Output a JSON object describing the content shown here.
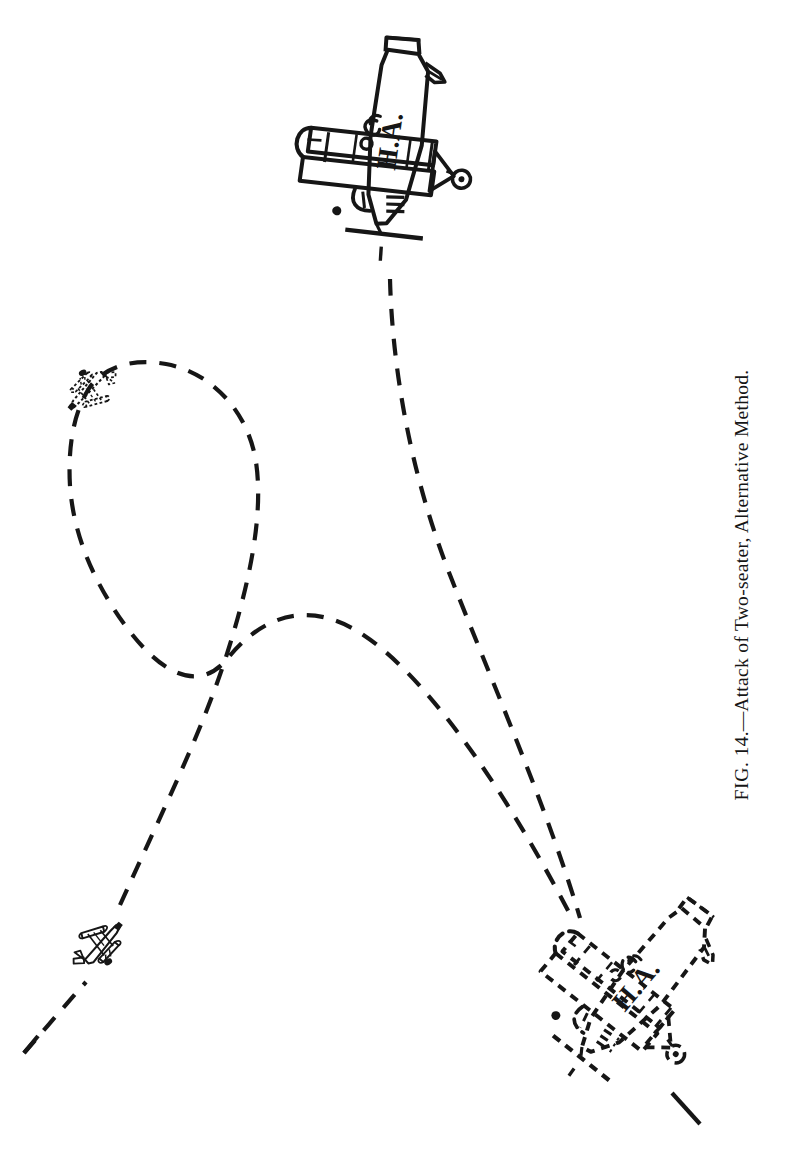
{
  "page": {
    "width": 794,
    "height": 1170,
    "background_color": "#ffffff",
    "ink_color": "#161616",
    "kind": "book-figure-scan"
  },
  "caption": {
    "label": "FIG.",
    "number": "14.",
    "dash": "—",
    "title": "Attack of Two-seater, Alternative Method.",
    "full_text": "FIG. 14.—Attack of Two-seater, Alternative Method.",
    "rotation_degrees": -90,
    "position": {
      "x": 742,
      "y": 585
    }
  },
  "figure": {
    "title_in_caption": "Attack of Two-seater, Alternative Method.",
    "diagram_type": "tactical-maneuver-diagram",
    "aircraft": [
      {
        "id": "hostile-aircraft-initial",
        "name": "hostile-two-seater-initial",
        "marking": "H.A.",
        "line_style": "solid",
        "role": "target",
        "description": "Two-seater hostile aircraft, front/below view, initial position",
        "center": {
          "x": 389,
          "y": 163
        },
        "scale": 1.0,
        "rotation_degrees": 8
      },
      {
        "id": "hostile-aircraft-later",
        "name": "hostile-two-seater-later",
        "marking": "H.A.",
        "line_style": "dashed",
        "role": "target",
        "description": "Same hostile two-seater shown dashed at later position",
        "center": {
          "x": 624,
          "y": 1003
        },
        "scale": 0.98,
        "rotation_degrees": 40
      },
      {
        "id": "attacker-initial",
        "name": "attacking-fighter-initial",
        "marking": "",
        "line_style": "solid",
        "role": "attacker",
        "description": "Single-seat fighter, attacker at start of maneuver",
        "center": {
          "x": 102,
          "y": 944
        },
        "scale": 0.42,
        "rotation_degrees": -32
      },
      {
        "id": "attacker-later",
        "name": "attacking-fighter-later",
        "marking": "",
        "line_style": "dashed",
        "role": "attacker",
        "description": "Attacking fighter shown dashed at top of climbing turn",
        "center": {
          "x": 88,
          "y": 390
        },
        "scale": 0.4,
        "rotation_degrees": 150
      }
    ],
    "flight_paths": [
      {
        "id": "hostile-path",
        "name": "hostile-aircraft-flight-path",
        "line_style": "dashed",
        "belongs_to": "hostile-two-seater",
        "description": "Dashed track of the hostile two-seater descending from top centre to lower right"
      },
      {
        "id": "attacker-path",
        "name": "attacker-flight-path",
        "line_style": "dashed",
        "belongs_to": "attacking-fighter",
        "description": "Dashed track of the attacker: climbing left turn, loop over the top, then diving attack down to the right"
      }
    ],
    "path_crossing_point": {
      "x": 228,
      "y": 658
    },
    "stroke": {
      "dash_length": 17,
      "dash_gap": 13,
      "width": 4.2
    }
  }
}
